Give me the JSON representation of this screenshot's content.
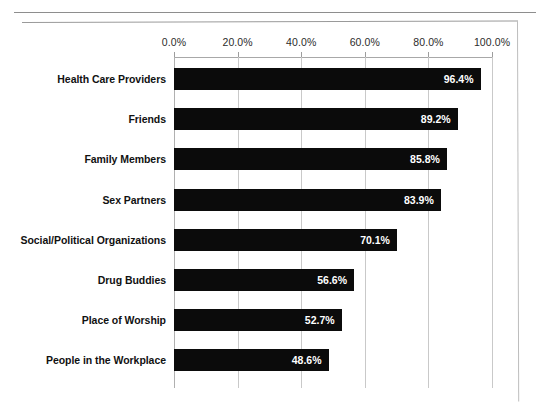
{
  "chart_data": {
    "type": "bar",
    "orientation": "horizontal",
    "title": "",
    "subtitle": "",
    "xlabel": "",
    "ylabel": "",
    "xlim": [
      0,
      100
    ],
    "grid": true,
    "legend": false,
    "legend_position": "none",
    "bar_color": "#0b0b0b",
    "value_label_color": "#ffffff",
    "x_ticks": [
      "0.0%",
      "20.0%",
      "40.0%",
      "60.0%",
      "80.0%",
      "100.0%"
    ],
    "x_tick_values": [
      0,
      20,
      40,
      60,
      80,
      100
    ],
    "categories": [
      "Health Care Providers",
      "Friends",
      "Family Members",
      "Sex Partners",
      "Social/Political Organizations",
      "Drug Buddies",
      "Place of Worship",
      "People in the Workplace"
    ],
    "values": [
      96.4,
      89.2,
      85.8,
      83.9,
      70.1,
      56.6,
      52.7,
      48.6
    ],
    "value_labels": [
      "96.4%",
      "89.2%",
      "85.8%",
      "83.9%",
      "70.1%",
      "56.6%",
      "52.7%",
      "48.6%"
    ]
  }
}
